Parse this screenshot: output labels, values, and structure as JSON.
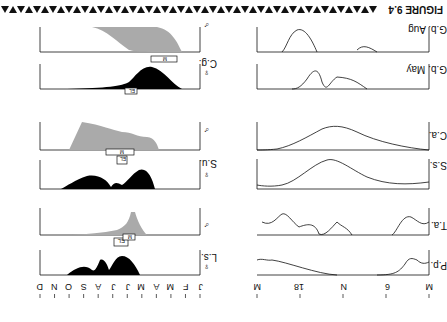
{
  "figure": {
    "label": "FIGURE 9.4",
    "orientation": "rotated 180°",
    "band_glyph": "▲▼"
  },
  "chart_data": [
    {
      "type": "area",
      "title": "Seasonal activity (annual)",
      "xlabel": "Month",
      "categories": [
        "J",
        "F",
        "M",
        "A",
        "M",
        "J",
        "J",
        "A",
        "S",
        "O",
        "N",
        "D"
      ],
      "markers": {
        "mating": "M",
        "egg_laying": "EL"
      },
      "series": [
        {
          "name": "L.s. ♀",
          "fill": "#000000",
          "values": [
            0,
            0,
            0,
            8,
            10,
            9,
            4,
            6,
            3,
            2,
            0,
            0
          ]
        },
        {
          "name": "L.s. ♂",
          "fill": "#aaaaaa",
          "values": [
            0,
            0,
            1,
            3,
            9,
            4,
            2,
            1,
            0,
            0,
            0,
            0
          ]
        },
        {
          "name": "S.u. ♀",
          "fill": "#000000",
          "values": [
            0,
            0,
            0,
            6,
            9,
            8,
            7,
            5,
            3,
            1,
            0,
            0
          ]
        },
        {
          "name": "S.u. ♂",
          "fill": "#aaaaaa",
          "values": [
            0,
            0,
            0,
            5,
            8,
            9,
            7,
            6,
            4,
            2,
            0,
            0
          ]
        },
        {
          "name": "C.g. ♀",
          "fill": "#000000",
          "values": [
            0,
            0,
            0,
            6,
            9,
            10,
            8,
            5,
            2,
            1,
            0,
            0
          ]
        },
        {
          "name": "C.g. ♂",
          "fill": "#aaaaaa",
          "values": [
            0,
            0,
            0,
            6,
            8,
            9,
            8,
            5,
            2,
            1,
            0,
            0
          ]
        }
      ]
    },
    {
      "type": "line",
      "title": "Daily activity",
      "xlabel": "Time of day",
      "categories": [
        "M",
        "6",
        "N",
        "18",
        "M"
      ],
      "series": [
        {
          "name": "P.p.",
          "values": [
            5,
            1,
            0,
            0,
            9,
            3
          ]
        },
        {
          "name": "T.a.",
          "values": [
            4,
            9,
            2,
            8,
            3,
            4,
            10,
            5
          ]
        },
        {
          "name": "S.s.",
          "values": [
            1,
            1,
            5,
            9,
            6,
            3,
            1
          ]
        },
        {
          "name": "C.a.",
          "values": [
            1,
            4,
            8,
            9,
            6,
            2,
            0
          ]
        },
        {
          "name": "G.b. May",
          "values": [
            0,
            3,
            4,
            2,
            9,
            0
          ]
        },
        {
          "name": "G.b. Aug",
          "values": [
            0,
            3,
            0,
            1,
            9,
            0
          ]
        }
      ]
    }
  ],
  "labels": {
    "months": [
      "J",
      "F",
      "M",
      "A",
      "M",
      "J",
      "J",
      "A",
      "S",
      "O",
      "N",
      "D"
    ],
    "hours": [
      "M",
      "6",
      "N",
      "18",
      "M"
    ],
    "left_rows": [
      "L.s.",
      "S.u.",
      "C.g."
    ],
    "right_rows": [
      "P.p.",
      "T.a.",
      "S.s.",
      "C.a.",
      "G.b.\nMay",
      "G.b.\nAug"
    ],
    "female": "♀",
    "male": "♂",
    "box_mating": "M",
    "box_egg": "EL"
  }
}
